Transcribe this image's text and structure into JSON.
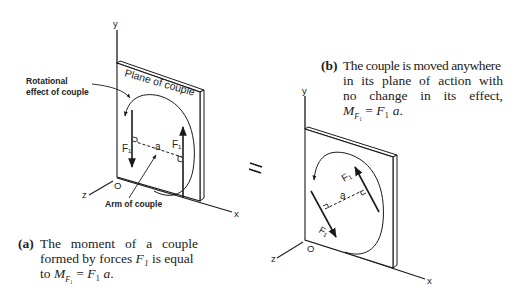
{
  "figure": {
    "panel_a": {
      "axes": {
        "y": "y",
        "x": "x",
        "z": "z",
        "origin": "O"
      },
      "plane_label": "Plane of couple",
      "callout_rotation": "Rotational effect of couple",
      "callout_arm": "Arm of couple",
      "force_left_label": "F₁",
      "force_right_label": "F₁",
      "arm_label": "a",
      "caption_tag": "(a)",
      "caption_line1": "The moment of a couple",
      "caption_line2_pre": "formed by forces ",
      "caption_line2_var": "F₁",
      "caption_line2_post": " is equal",
      "caption_line3_pre": "to ",
      "caption_line3_eq": "M_F₁ = F₁ a."
    },
    "equals_sign": "=",
    "panel_b": {
      "axes": {
        "y": "y",
        "x": "x",
        "z": "z",
        "origin": "O"
      },
      "force_upper_label": "F₁",
      "force_lower_label": "F₁",
      "arm_label": "a",
      "caption_tag": "(b)",
      "caption_line1": "The couple is moved anywhere",
      "caption_line2": "in its plane of action with",
      "caption_line3": "no change in its effect,",
      "caption_line4": "M_F₁ = F₁ a."
    }
  }
}
